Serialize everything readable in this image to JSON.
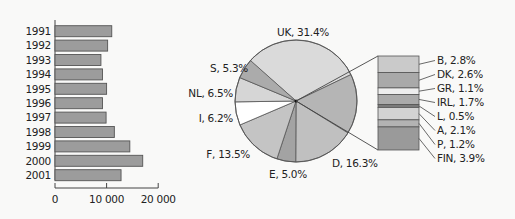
{
  "chart_data": [
    {
      "type": "bar",
      "orientation": "horizontal",
      "title": "",
      "xlabel": "",
      "ylabel": "",
      "categories": [
        "1991",
        "1992",
        "1993",
        "1994",
        "1995",
        "1996",
        "1997",
        "1998",
        "1999",
        "2000",
        "2001"
      ],
      "values": [
        11000,
        10200,
        8900,
        9200,
        10000,
        9200,
        9900,
        11500,
        14500,
        17000,
        12800
      ],
      "xlim": [
        0,
        20000
      ],
      "xticks": [
        0,
        10000,
        20000
      ],
      "xtick_labels": [
        "0",
        "10 000",
        "20 000"
      ],
      "grid": false,
      "bar_color": "#9c9c9c"
    },
    {
      "type": "pie",
      "title": "",
      "slices": [
        {
          "label": "UK",
          "value": 31.4,
          "text": "UK, 31.4%",
          "color": "#dadada"
        },
        {
          "label": "Others",
          "value": 15.9,
          "text": "",
          "color": "#b5b5b5"
        },
        {
          "label": "D",
          "value": 16.3,
          "text": "D, 16.3%",
          "color": "#c0c0c0"
        },
        {
          "label": "E",
          "value": 5.0,
          "text": "E, 5.0%",
          "color": "#a3a3a3"
        },
        {
          "label": "F",
          "value": 13.5,
          "text": "F, 13.5%",
          "color": "#c4c4c4"
        },
        {
          "label": "I",
          "value": 6.2,
          "text": "I, 6.2%",
          "color": "#ffffff"
        },
        {
          "label": "NL",
          "value": 6.5,
          "text": "NL, 6.5%",
          "color": "#d6d6d6"
        },
        {
          "label": "S",
          "value": 5.3,
          "text": "S, 5.3%",
          "color": "#ababab"
        }
      ],
      "breakout": {
        "of": "Others",
        "type": "stacked-bar",
        "segments": [
          {
            "label": "B",
            "value": 2.8,
            "text": "B, 2.8%",
            "color": "#cacaca"
          },
          {
            "label": "DK",
            "value": 2.6,
            "text": "DK, 2.6%",
            "color": "#a9a9a9"
          },
          {
            "label": "GR",
            "value": 1.1,
            "text": "GR, 1.1%",
            "color": "#ededed"
          },
          {
            "label": "IRL",
            "value": 1.7,
            "text": "IRL, 1.7%",
            "color": "#aaaaaa"
          },
          {
            "label": "L",
            "value": 0.5,
            "text": "L, 0.5%",
            "color": "#7a7a7a"
          },
          {
            "label": "A",
            "value": 2.1,
            "text": "A, 2.1%",
            "color": "#d3d3d3"
          },
          {
            "label": "P",
            "value": 1.2,
            "text": "P, 1.2%",
            "color": "#b3b3b3"
          },
          {
            "label": "FIN",
            "value": 3.9,
            "text": "FIN, 3.9%",
            "color": "#9a9a9a"
          }
        ]
      }
    }
  ]
}
